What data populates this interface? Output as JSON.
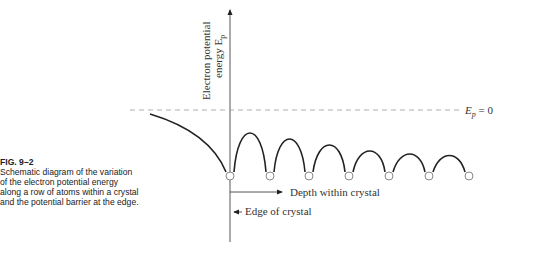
{
  "caption": {
    "figure_label": "FIG. 9–2",
    "text": "Schematic diagram of the variation of the electron potential energy along a row of atoms within a crystal and the potential barrier at the edge."
  },
  "diagram": {
    "y_axis_label_line1": "Electron potential",
    "y_axis_label_line2": "energy E",
    "y_axis_label_sub": "p",
    "zero_line_label": "E",
    "zero_line_label_sub": "p",
    "zero_line_label_rest": " = 0",
    "depth_label": "Depth within crystal",
    "edge_label": "Edge of crystal",
    "atom_count": 7
  }
}
